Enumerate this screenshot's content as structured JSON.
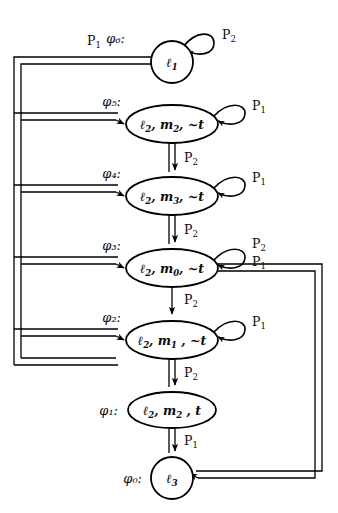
{
  "figure": {
    "kind": "state-transition-diagram",
    "caption": "",
    "background": "#ffffff",
    "ink": "#000000"
  },
  "states": [
    {
      "id": "phi6",
      "phi_label": "φ₆:",
      "shape": "circle",
      "contents": "ℓ₁",
      "parts": [
        {
          "base": "ℓ",
          "sub": "1"
        }
      ],
      "cx": 172,
      "cy": 62,
      "rx": 21,
      "ry": 21,
      "self_loop": {
        "label": "P₂",
        "base": "P",
        "sub": "2",
        "side": "right"
      }
    },
    {
      "id": "phi5",
      "phi_label": "φ₅:",
      "shape": "ellipse",
      "contents": "ℓ₂ , m₂, ~t",
      "parts": [
        {
          "base": "ℓ",
          "sub": "2"
        },
        {
          "base": ", m",
          "sub": "2"
        },
        {
          "base": ", ~t",
          "sub": ""
        }
      ],
      "cx": 172,
      "cy": 124,
      "rx": 46,
      "ry": 19,
      "self_loop": {
        "label": "P₁",
        "base": "P",
        "sub": "1",
        "side": "right"
      }
    },
    {
      "id": "phi4",
      "phi_label": "φ₄:",
      "shape": "ellipse",
      "contents": "ℓ₂ , m₃, ~t",
      "parts": [
        {
          "base": "ℓ",
          "sub": "2"
        },
        {
          "base": ", m",
          "sub": "3"
        },
        {
          "base": ", ~t",
          "sub": ""
        }
      ],
      "cx": 172,
      "cy": 196,
      "rx": 46,
      "ry": 19,
      "self_loop": {
        "label": "P₁",
        "base": "P",
        "sub": "1",
        "side": "right"
      }
    },
    {
      "id": "phi3",
      "phi_label": "φ₃:",
      "shape": "ellipse",
      "contents": "ℓ₂ , m₀, ~t",
      "parts": [
        {
          "base": "ℓ",
          "sub": "2"
        },
        {
          "base": ", m",
          "sub": "0"
        },
        {
          "base": ", ~t",
          "sub": ""
        }
      ],
      "cx": 172,
      "cy": 268,
      "rx": 46,
      "ry": 19,
      "self_loop": {
        "label": "P₂",
        "base": "P",
        "sub": "2",
        "side": "right"
      }
    },
    {
      "id": "phi2",
      "phi_label": "φ₂:",
      "shape": "ellipse",
      "contents": "ℓ₂ , m₁ , ~t",
      "parts": [
        {
          "base": "ℓ",
          "sub": "2"
        },
        {
          "base": ", m",
          "sub": "1"
        },
        {
          "base": " , ~t",
          "sub": ""
        }
      ],
      "cx": 172,
      "cy": 340,
      "rx": 46,
      "ry": 19,
      "self_loop": {
        "label": "P₁",
        "base": "P",
        "sub": "1",
        "side": "right"
      }
    },
    {
      "id": "phi1",
      "phi_label": "φ₁:",
      "shape": "ellipse",
      "contents": "ℓ₂ , m₂ , t",
      "parts": [
        {
          "base": "ℓ",
          "sub": "2"
        },
        {
          "base": ", m",
          "sub": "2"
        },
        {
          "base": " , t",
          "sub": ""
        }
      ],
      "cx": 172,
      "cy": 410,
      "rx": 44,
      "ry": 18,
      "self_loop": null
    },
    {
      "id": "phi0",
      "phi_label": "φ₀:",
      "shape": "circle",
      "contents": "ℓ₃",
      "parts": [
        {
          "base": "ℓ",
          "sub": "3"
        }
      ],
      "cx": 172,
      "cy": 478,
      "rx": 21,
      "ry": 21,
      "self_loop": null
    }
  ],
  "transitions": [
    {
      "id": "t-phi5-phi4",
      "from": "phi5",
      "to": "phi4",
      "label": "P₂",
      "base": "P",
      "sub": "2",
      "style": "double",
      "route": "vertical"
    },
    {
      "id": "t-phi4-phi3",
      "from": "phi4",
      "to": "phi3",
      "label": "P₂",
      "base": "P",
      "sub": "2",
      "style": "double",
      "route": "vertical"
    },
    {
      "id": "t-phi3-phi2",
      "from": "phi3",
      "to": "phi2",
      "label": "P₂",
      "base": "P",
      "sub": "2",
      "style": "single",
      "route": "vertical"
    },
    {
      "id": "t-phi2-phi1",
      "from": "phi2",
      "to": "phi1",
      "label": "P₂",
      "base": "P",
      "sub": "2",
      "style": "double",
      "route": "vertical"
    },
    {
      "id": "t-phi1-phi0",
      "from": "phi1",
      "to": "phi0",
      "label": "P₁",
      "base": "P",
      "sub": "1",
      "style": "double",
      "route": "vertical"
    },
    {
      "id": "t-phi6-left",
      "from": "phi6",
      "to": "left-bus",
      "label": "P₁",
      "base": "P",
      "sub": "1",
      "style": "double",
      "route": "left-out-top"
    },
    {
      "id": "t-left-phi5",
      "from": "left-bus",
      "to": "phi5",
      "label": "",
      "base": "",
      "sub": "",
      "style": "double",
      "route": "left-in"
    },
    {
      "id": "t-left-phi4",
      "from": "left-bus",
      "to": "phi4",
      "label": "",
      "base": "",
      "sub": "",
      "style": "double",
      "route": "left-in"
    },
    {
      "id": "t-left-phi3",
      "from": "left-bus",
      "to": "phi3",
      "label": "",
      "base": "",
      "sub": "",
      "style": "double",
      "route": "left-in"
    },
    {
      "id": "t-left-phi2",
      "from": "left-bus",
      "to": "phi2",
      "label": "",
      "base": "",
      "sub": "",
      "style": "double",
      "route": "left-in"
    },
    {
      "id": "t-phi3-phi0",
      "from": "phi3",
      "to": "phi0",
      "label": "P₁",
      "base": "P",
      "sub": "1",
      "style": "double",
      "route": "right-loop"
    }
  ],
  "edge_labels": {
    "top_p1": {
      "label": "P₁",
      "base": "P",
      "sub": "1"
    },
    "right_p1": {
      "label": "P₁",
      "base": "P",
      "sub": "1"
    }
  }
}
